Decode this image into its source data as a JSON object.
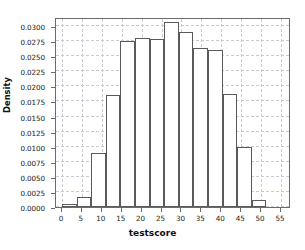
{
  "chart_data": {
    "type": "bar",
    "title": "",
    "subtitle": "",
    "xlabel": "testscore",
    "ylabel": "Density",
    "grid": true,
    "legend": null,
    "xlim": [
      -1.5,
      57.5
    ],
    "ylim": [
      0.0,
      0.0315
    ],
    "bin_width": 3.67,
    "bin_edges": [
      0.0,
      3.67,
      7.33,
      11.0,
      14.67,
      18.33,
      22.0,
      25.67,
      29.33,
      33.0,
      36.67,
      40.33,
      44.0,
      47.67,
      51.33,
      55.0
    ],
    "categories": [
      "0.0-3.7",
      "3.7-7.3",
      "7.3-11.0",
      "11.0-14.7",
      "14.7-18.3",
      "18.3-22.0",
      "22.0-25.7",
      "25.7-29.3",
      "29.3-33.0",
      "33.0-36.7",
      "36.7-40.3",
      "40.3-44.0",
      "44.0-47.7",
      "47.7-51.3",
      "51.3-55.0"
    ],
    "values": [
      0.0005,
      0.0017,
      0.009,
      0.0186,
      0.0275,
      0.0281,
      0.0279,
      0.0306,
      0.029,
      0.0264,
      0.026,
      0.0188,
      0.0099,
      0.0012,
      0.0
    ],
    "xticks": [
      0,
      5,
      10,
      15,
      20,
      25,
      30,
      35,
      40,
      45,
      50,
      55
    ],
    "xtick_labels": [
      "0",
      "5",
      "10",
      "15",
      "20",
      "25",
      "30",
      "35",
      "40",
      "45",
      "50",
      "55"
    ],
    "yticks": [
      0.0,
      0.0025,
      0.005,
      0.0075,
      0.01,
      0.0125,
      0.015,
      0.0175,
      0.02,
      0.0225,
      0.025,
      0.0275,
      0.03
    ],
    "ytick_labels": [
      "0.0000",
      "0.0025",
      "0.0050",
      "0.0075",
      "0.0100",
      "0.0125",
      "0.0150",
      "0.0175",
      "0.0200",
      "0.0225",
      "0.0250",
      "0.0275",
      "0.0300"
    ],
    "colors": {
      "bar_fill": "#ffffff",
      "bar_edge": "#5a5a5a",
      "grid": "#c9c9d6",
      "axis": "#6b6b6b",
      "text": "#1a1a1a"
    }
  }
}
